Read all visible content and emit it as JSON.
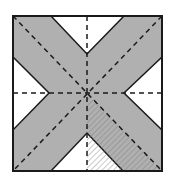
{
  "figure": {
    "colors": {
      "background": "#ffffff",
      "shaded": "#b0b0b0",
      "outline": "#1a1a1a",
      "dash": "#1a1a1a",
      "hatch": "#7a7a7a"
    },
    "square": {
      "x1": 13,
      "y1": 16,
      "x2": 162,
      "y2": 171
    },
    "center": {
      "x": 87,
      "y": 93
    },
    "notches": [
      {
        "name": "top",
        "points": "51,16 87,54 124,16"
      },
      {
        "name": "left",
        "points": "13,57 49,93 13,130"
      },
      {
        "name": "right",
        "points": "162,57 124,93 162,130"
      },
      {
        "name": "bottom",
        "points": "51,171 87,133 123,171"
      }
    ],
    "dashed_lines": [
      {
        "name": "vertical",
        "x1": 87,
        "y1": 16,
        "x2": 87,
        "y2": 171
      },
      {
        "name": "horizontal",
        "x1": 13,
        "y1": 93,
        "x2": 162,
        "y2": 93
      },
      {
        "name": "diagonal-main",
        "x1": 13,
        "y1": 16,
        "x2": 162,
        "y2": 171
      },
      {
        "name": "diagonal-anti",
        "x1": 162,
        "y1": 16,
        "x2": 13,
        "y2": 171
      }
    ],
    "hatched_region": {
      "points": "87,93 162,171 87,171"
    }
  }
}
